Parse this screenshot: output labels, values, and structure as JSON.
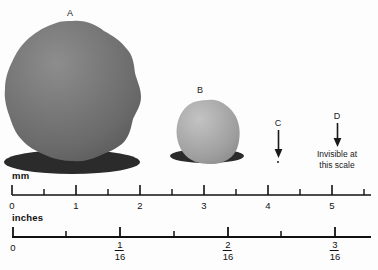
{
  "figure": {
    "background_color": "#fdfdfd"
  },
  "particles": [
    {
      "label": "A",
      "fill_color": "#6f6f6f",
      "highlight_color": "#8a8a8a",
      "shadow_color": "#2b2b2b",
      "center_x_mm": 0.9,
      "diameter_mm": 2.1
    },
    {
      "label": "B",
      "fill_color": "#a4a4a4",
      "highlight_color": "#bcbcbc",
      "shadow_color": "#2b2b2b",
      "center_x_mm": 3.05,
      "diameter_mm": 1.0
    }
  ],
  "markers": [
    {
      "label": "C",
      "position_mm": 4.0,
      "note": "",
      "has_dot": true
    },
    {
      "label": "D",
      "position_mm": 5.0,
      "note_line1": "Invisible at",
      "note_line2": "this scale",
      "has_dot": false
    }
  ],
  "rulers": [
    {
      "name": "mm",
      "unit": "mm",
      "major_ticks": [
        "0",
        "1",
        "2",
        "3",
        "4",
        "5"
      ],
      "major_values": [
        0,
        1,
        2,
        3,
        4,
        5
      ],
      "minor_values": [
        0.5,
        1.5,
        2.5,
        3.5,
        4.5,
        5.5
      ],
      "axis_start": 0,
      "axis_end": 5.6
    },
    {
      "name": "inches",
      "unit": "inches",
      "major_ticks": [
        "0",
        "1/16",
        "2/16",
        "3/16"
      ],
      "major_values": [
        0,
        1,
        2,
        3
      ],
      "major_numerators": [
        "",
        "1",
        "2",
        "3"
      ],
      "major_denominators": [
        "",
        "16",
        "16",
        "16"
      ],
      "minor_values": [
        0.5,
        1.5,
        2.5,
        3.5
      ],
      "axis_start": 0,
      "axis_end": 3.35
    }
  ],
  "chart_data": {
    "type": "scatter",
    "xlabel": "mm",
    "categories": [
      "A",
      "B",
      "C",
      "D"
    ],
    "values": [
      2.1,
      1.0,
      0.04,
      0.0
    ],
    "series": [
      {
        "name": "diameter_mm",
        "values": [
          2.1,
          1.0,
          0.04,
          0.0
        ]
      },
      {
        "name": "position_mm",
        "values": [
          0.9,
          3.05,
          4.0,
          5.0
        ]
      }
    ],
    "xlim": [
      0,
      5.6
    ],
    "grid": false,
    "annotations": [
      "Invisible at this scale"
    ]
  }
}
